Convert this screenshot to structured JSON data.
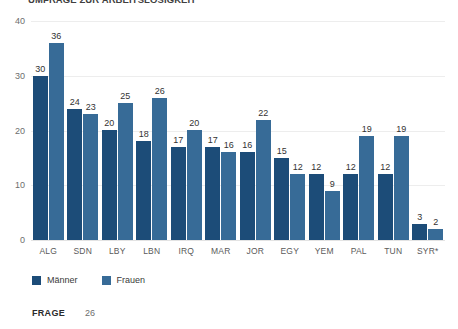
{
  "title": "UMFRAGE ZUR ARBEITSLOSIGKEIT",
  "footer": {
    "key": "FRAGE",
    "value": "26"
  },
  "legend": {
    "items": [
      {
        "label": "Männer",
        "color": "#1c4c78",
        "swatch": "square-swatch"
      },
      {
        "label": "Frauen",
        "color": "#376b97",
        "swatch": "square-swatch"
      }
    ]
  },
  "chart_data": {
    "type": "bar",
    "title": "UMFRAGE ZUR ARBEITSLOSIGKEIT",
    "xlabel": "",
    "ylabel": "",
    "ylim": [
      0,
      40
    ],
    "yticks": [
      0,
      10,
      20,
      30,
      40
    ],
    "grid": true,
    "legend_position": "bottom-left",
    "categories": [
      "ALG",
      "SDN",
      "LBY",
      "LBN",
      "IRQ",
      "MAR",
      "JOR",
      "EGY",
      "YEM",
      "PAL",
      "TUN",
      "SYR*"
    ],
    "series": [
      {
        "name": "Männer",
        "color": "#1c4c78",
        "values": [
          30,
          24,
          20,
          18,
          17,
          17,
          16,
          15,
          12,
          12,
          12,
          3
        ]
      },
      {
        "name": "Frauen",
        "color": "#376b97",
        "values": [
          36,
          23,
          25,
          26,
          20,
          16,
          22,
          12,
          9,
          19,
          19,
          2
        ]
      }
    ]
  }
}
